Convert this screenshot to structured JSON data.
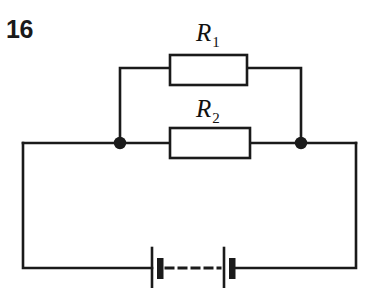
{
  "figure": {
    "number": "16",
    "kind": "circuit-diagram"
  },
  "components": {
    "resistor_1": {
      "label": "R",
      "subscript": "1",
      "shape": "rectangle",
      "box": {
        "x": 170,
        "y": 55,
        "width": 77,
        "height": 30
      },
      "label_pos": {
        "x": 196,
        "y": 20
      }
    },
    "resistor_2": {
      "label": "R",
      "subscript": "2",
      "shape": "rectangle",
      "box": {
        "x": 170,
        "y": 128,
        "width": 80,
        "height": 30
      },
      "label_pos": {
        "x": 196,
        "y": 96
      }
    },
    "battery": {
      "cells": 2,
      "style": "dashed-link",
      "long_plates_x": [
        152,
        224
      ],
      "short_plates_x": [
        160,
        232
      ]
    },
    "junction_dots": [
      {
        "name": "left-node",
        "x": 120,
        "y": 143,
        "r": 6
      },
      {
        "name": "right-node",
        "x": 301,
        "y": 143,
        "r": 6
      }
    ]
  },
  "geometry": {
    "outer_loop": {
      "left": 23,
      "right": 356,
      "mid_y": 143,
      "bottom_y": 268
    },
    "top_branch_y": 68,
    "stroke_color": "#1a1a1a",
    "background_color": "#ffffff",
    "stroke_width": 2.6
  },
  "colors": {
    "ink": "#1a1a1a",
    "paper": "#ffffff"
  }
}
